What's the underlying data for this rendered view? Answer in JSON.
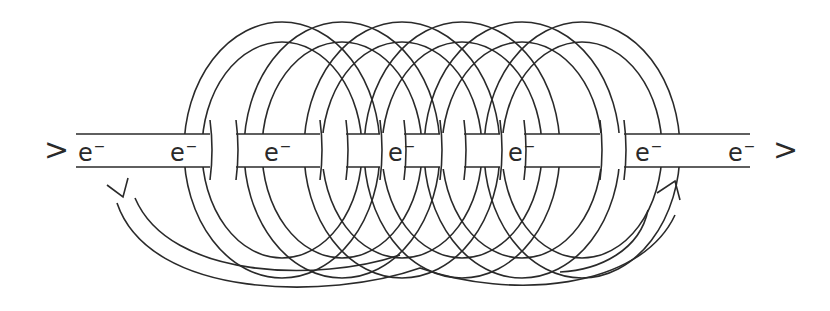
{
  "diagram": {
    "type": "solenoid-electron-flow",
    "colors": {
      "line": "#2a2a2a",
      "background": "#ffffff"
    },
    "wire": {
      "label": "wire",
      "direction": "left-to-right"
    },
    "entry_marker": ">",
    "exit_marker": ">",
    "electrons": [
      {
        "base": "e",
        "charge": "−",
        "x": 78
      },
      {
        "base": "e",
        "charge": "−",
        "x": 170
      },
      {
        "base": "e",
        "charge": "−",
        "x": 264
      },
      {
        "base": "e",
        "charge": "−",
        "x": 388
      },
      {
        "base": "e",
        "charge": "−",
        "x": 508
      },
      {
        "base": "e",
        "charge": "−",
        "x": 635
      },
      {
        "base": "e",
        "charge": "−",
        "x": 728
      }
    ],
    "coil": {
      "turns": 6,
      "label": "coil-turns"
    },
    "circulation_arrow": {
      "label": "current-circulation-arrow",
      "direction": "counter-clockwise-viewed-from-left"
    }
  }
}
